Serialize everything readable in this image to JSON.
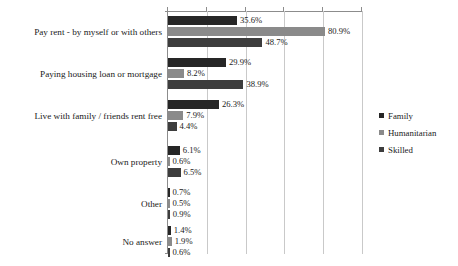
{
  "chart_data": {
    "type": "bar",
    "orientation": "horizontal",
    "title": "",
    "subtitle": "",
    "xlabel": "",
    "ylabel": "",
    "xlim": [
      0,
      100
    ],
    "grid": true,
    "gridline_values": [
      0,
      20,
      40,
      60,
      80,
      100
    ],
    "axis_tick_labels": [],
    "legend_position": "right",
    "categories": [
      "Pay rent - by myself or with others",
      "Paying housing loan or mortgage",
      "Live with family / friends rent free",
      "Own property",
      "Other",
      "No answer"
    ],
    "series": [
      {
        "name": "Family",
        "color": "#262626",
        "values": [
          35.6,
          29.9,
          26.3,
          6.1,
          0.7,
          1.4
        ],
        "labels": [
          "35.6%",
          "29.9%",
          "26.3%",
          "6.1%",
          "0.7%",
          "1.4%"
        ]
      },
      {
        "name": "Humanitarian",
        "color": "#8a8a8a",
        "values": [
          80.9,
          8.2,
          7.9,
          0.6,
          0.5,
          1.9
        ],
        "labels": [
          "80.9%",
          "8.2%",
          "7.9%",
          "0.6%",
          "0.5%",
          "1.9%"
        ]
      },
      {
        "name": "Skilled",
        "color": "#3d3d3d",
        "values": [
          48.7,
          38.9,
          4.4,
          6.5,
          0.9,
          0.6
        ],
        "labels": [
          "48.7%",
          "38.9%",
          "4.4%",
          "6.5%",
          "0.9%",
          "0.6%"
        ]
      }
    ]
  },
  "legend": {
    "items": [
      {
        "label": "Family",
        "color": "#262626"
      },
      {
        "label": "Humanitarian",
        "color": "#8a8a8a"
      },
      {
        "label": "Skilled",
        "color": "#3d3d3d"
      }
    ]
  }
}
